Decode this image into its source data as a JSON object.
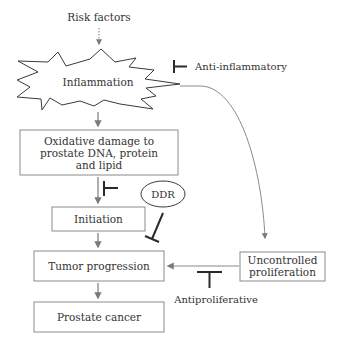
{
  "diagram": {
    "colors": {
      "box_stroke": "#8a8a8a",
      "arrow": "#7a7a7a",
      "inhibitor": "#2b2b2b",
      "text": "#333333",
      "background": "#ffffff"
    },
    "nodes": {
      "risk_factors": "Risk factors",
      "inflammation": "Inflammation",
      "anti_inflammatory": "Anti-inflammatory",
      "oxidative_damage": [
        "Oxidative damage to",
        "prostate DNA, protein",
        "and lipid"
      ],
      "ddr": "DDR",
      "initiation": "Initiation",
      "tumor_progression": "Tumor progression",
      "uncontrolled_proliferation": [
        "Uncontrolled",
        "proliferation"
      ],
      "antiproliferative": "Antiproliferative",
      "prostate_cancer": "Prostate cancer"
    },
    "edges": [
      {
        "from": "Risk factors",
        "to": "Inflammation",
        "type": "dotted-arrow"
      },
      {
        "from": "Anti-inflammatory",
        "to": "Inflammation",
        "type": "inhibition"
      },
      {
        "from": "Inflammation",
        "to": "Oxidative damage to prostate DNA, protein and lipid",
        "type": "arrow"
      },
      {
        "from": "Inflammation",
        "to": "Uncontrolled proliferation",
        "type": "curved-arrow"
      },
      {
        "from": "Oxidative damage to prostate DNA, protein and lipid",
        "to": "Initiation",
        "type": "arrow"
      },
      {
        "from": "DDR",
        "to": "Oxidative damage → Initiation",
        "type": "inhibition"
      },
      {
        "from": "DDR",
        "to": "Tumor progression",
        "type": "inhibition"
      },
      {
        "from": "Initiation",
        "to": "Tumor progression",
        "type": "arrow"
      },
      {
        "from": "Uncontrolled proliferation",
        "to": "Tumor progression",
        "type": "arrow"
      },
      {
        "from": "Antiproliferative",
        "to": "Uncontrolled proliferation → Tumor progression",
        "type": "inhibition"
      },
      {
        "from": "Tumor progression",
        "to": "Prostate cancer",
        "type": "arrow"
      }
    ]
  }
}
